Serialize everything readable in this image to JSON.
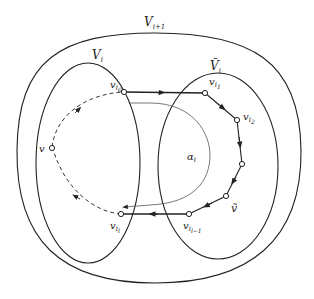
{
  "diagram": {
    "regions": [
      {
        "id": "outer",
        "label": "V",
        "sub": "i+1"
      },
      {
        "id": "left",
        "label": "V",
        "sub": "i"
      },
      {
        "id": "right",
        "label": "Ṽ",
        "sub": "i"
      }
    ],
    "vertices": [
      {
        "id": "vi0",
        "label": "v",
        "sub": "i",
        "subsub": "0"
      },
      {
        "id": "vi1",
        "label": "v",
        "sub": "i",
        "subsub": "1"
      },
      {
        "id": "vi2",
        "label": "v",
        "sub": "i",
        "subsub": "2"
      },
      {
        "id": "vi3",
        "label": "",
        "sub": "",
        "subsub": ""
      },
      {
        "id": "vtilde",
        "label": "ṽ",
        "sub": "",
        "subsub": ""
      },
      {
        "id": "vil1",
        "label": "v",
        "sub": "i",
        "subsub": "l−1"
      },
      {
        "id": "vil",
        "label": "v",
        "sub": "i",
        "subsub": "l"
      },
      {
        "id": "v",
        "label": "v",
        "sub": "",
        "subsub": ""
      }
    ],
    "path_label": {
      "label": "α",
      "sub": "i"
    },
    "colors": {
      "stroke": "#222222",
      "thin": "#555555",
      "background": "#ffffff"
    }
  }
}
